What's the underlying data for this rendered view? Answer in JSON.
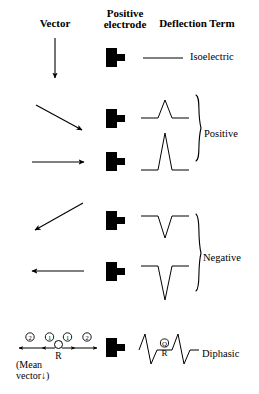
{
  "figure": {
    "columns": {
      "vector": "Vector",
      "positive_electrode_line1": "Positive",
      "positive_electrode_line2": "electrode",
      "deflection": "Deflection",
      "term": "Term"
    },
    "ink_color": "#000000",
    "background_color": "#ffffff"
  },
  "rows": [
    {
      "id": "row-isoelectric",
      "vector_direction": "down",
      "vector_angle_deg": 90,
      "electrode_icon": "electrode-plug-icon",
      "deflection_shape": "flat-line",
      "deflection_amplitude": 0,
      "term": "Isoelectric"
    },
    {
      "id": "row-positive-small",
      "vector_direction": "down-right",
      "vector_angle_deg": 35,
      "electrode_icon": "electrode-plug-icon",
      "deflection_shape": "small-upward-spike",
      "deflection_amplitude": 1,
      "term": ""
    },
    {
      "id": "row-positive-large",
      "vector_direction": "right",
      "vector_angle_deg": 0,
      "electrode_icon": "electrode-plug-icon",
      "deflection_shape": "tall-upward-spike",
      "deflection_amplitude": 2,
      "term": ""
    },
    {
      "id": "row-negative-small",
      "vector_direction": "down-left",
      "vector_angle_deg": 215,
      "electrode_icon": "electrode-plug-icon",
      "deflection_shape": "small-downward-spike",
      "deflection_amplitude": -1,
      "term": ""
    },
    {
      "id": "row-negative-large",
      "vector_direction": "left",
      "vector_angle_deg": 180,
      "electrode_icon": "electrode-plug-icon",
      "deflection_shape": "deep-downward-spike",
      "deflection_amplitude": -2,
      "term": ""
    },
    {
      "id": "row-diphasic",
      "vector_direction": "mean-vector-diagram",
      "electrode_icon": "electrode-plug-icon",
      "deflection_shape": "diphasic-qrs-complex",
      "deflection_amplitude": 0,
      "term": "Diphasic"
    }
  ],
  "braces": [
    {
      "id": "brace-positive",
      "label": "Positive",
      "spans_rows": [
        "row-positive-small",
        "row-positive-large"
      ]
    },
    {
      "id": "brace-negative",
      "label": "Negative",
      "spans_rows": [
        "row-negative-small",
        "row-negative-large"
      ]
    }
  ],
  "mean_vector_diagram": {
    "markers": [
      {
        "label": "2",
        "circled": true,
        "position": "far-left",
        "arrow": "left"
      },
      {
        "label": "1",
        "circled": true,
        "position": "near-left",
        "arrow": "left"
      },
      {
        "label": "1",
        "circled": true,
        "position": "near-right",
        "arrow": "right"
      },
      {
        "label": "2",
        "circled": true,
        "position": "far-right",
        "arrow": "right"
      }
    ],
    "center_node_label": "R",
    "caption_line1": "(Mean",
    "caption_line2": "vector",
    "caption_arrow": "↓",
    "caption_close": ")"
  },
  "diphasic_annotation": {
    "upper": "Q",
    "lower": "R"
  }
}
